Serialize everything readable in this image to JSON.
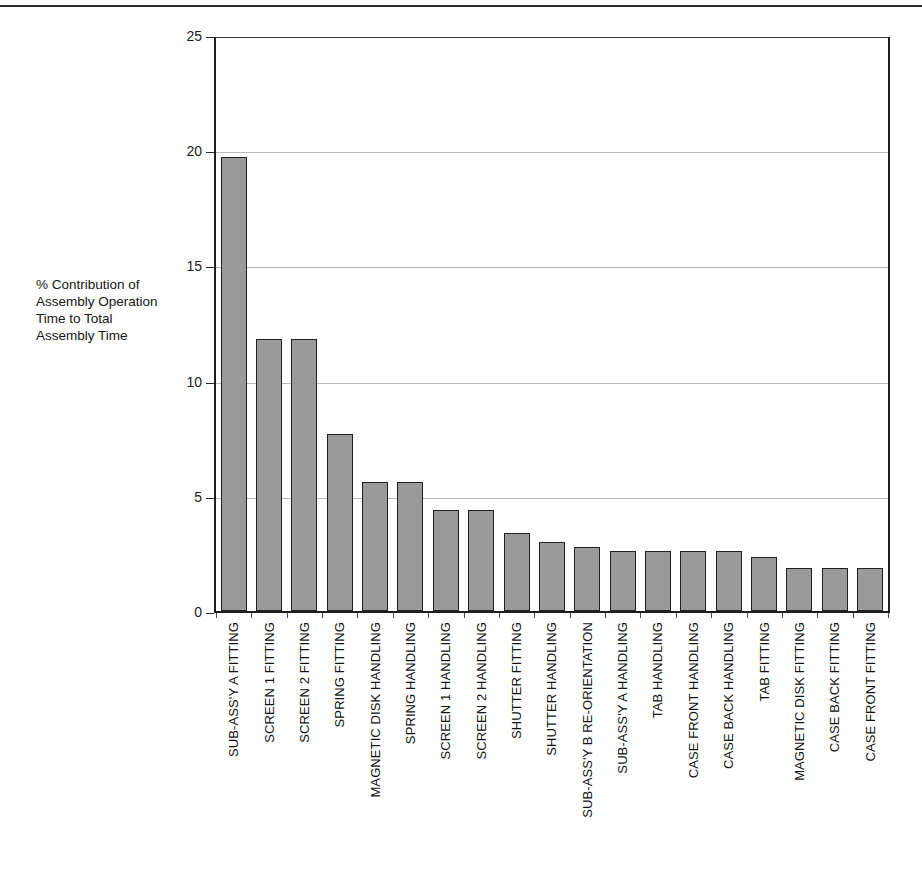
{
  "page": {
    "top_rule": true
  },
  "chart_data": {
    "type": "bar",
    "title": "",
    "subtitle": "",
    "xlabel": "",
    "ylabel": "% Contribution of Assembly Operation Time to Total Assembly Time",
    "ylabel_lines": [
      "% Contribution of",
      "Assembly Operation",
      "Time to Total",
      "Assembly Time"
    ],
    "ylim": [
      0,
      25
    ],
    "ytick_labels": [
      "25",
      "20",
      "15",
      "10",
      "5",
      "0"
    ],
    "yticks": [
      25,
      20,
      15,
      10,
      5,
      0
    ],
    "grid": true,
    "grid_axis": "y",
    "legend": false,
    "legend_position": "none",
    "bar_fill_color": "#9a9a9a",
    "bar_edge_color": "#202020",
    "categories": [
      "SUB-ASS'Y A FITTING",
      "SCREEN 1 FITTING",
      "SCREEN 2 FITTING",
      "SPRING FITTING",
      "MAGNETIC DISK HANDLING",
      "SPRING HANDLING",
      "SCREEN 1 HANDLING",
      "SCREEN 2 HANDLING",
      "SHUTTER FITTING",
      "SHUTTER HANDLING",
      "SUB-ASS'Y B RE-ORIENTATION",
      "SUB-ASS'Y A HANDLING",
      "TAB HANDLING",
      "CASE FRONT HANDLING",
      "CASE BACK HANDLING",
      "TAB FITTING",
      "MAGNETIC DISK FITTING",
      "CASE BACK FITTING",
      "CASE FRONT FITTING"
    ],
    "values": [
      19.7,
      11.8,
      11.8,
      7.7,
      5.6,
      5.6,
      4.4,
      4.4,
      3.4,
      3.0,
      2.8,
      2.6,
      2.6,
      2.6,
      2.6,
      2.35,
      1.85,
      1.85,
      1.85
    ]
  }
}
